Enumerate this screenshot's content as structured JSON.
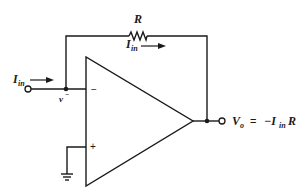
{
  "diagram": {
    "components": {
      "resistor": {
        "label": "R"
      },
      "opamp": {
        "inverting_sign": "−",
        "noninverting_sign": "+"
      }
    },
    "labels": {
      "input_current": {
        "main": "I",
        "sub": "in"
      },
      "feedback_current": {
        "main": "I",
        "sub": "in"
      },
      "inverting_node": {
        "main": "v",
        "sup": "−"
      },
      "output": {
        "lhs_main": "V",
        "lhs_sub": "o",
        "equals": "=",
        "rhs_prefix": "−I",
        "rhs_sub": "in",
        "rhs_suffix": "R"
      }
    },
    "colors": {
      "ink": "#1a1a1a",
      "background": "#ffffff"
    }
  }
}
